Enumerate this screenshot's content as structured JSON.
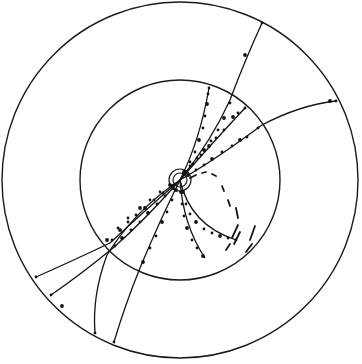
{
  "display": {
    "type": "particle-event-display",
    "width": 362,
    "height": 364,
    "colors": {
      "background": "#ffffff",
      "ink": "#141414"
    }
  },
  "detector": {
    "center": [
      180,
      180
    ],
    "outer_ring_radius": 178,
    "inner_ring_radius": 100,
    "vertex_rings": [
      7,
      11
    ]
  },
  "tracks": [
    {
      "id": "t1",
      "path": "M180,180 Q212,140 230,100 Q245,60 262,23",
      "hits": [
        [
          184,
          174
        ],
        [
          190,
          166
        ],
        [
          197,
          158
        ],
        [
          204,
          150
        ],
        [
          211,
          141
        ],
        [
          218,
          130
        ],
        [
          224,
          118
        ],
        [
          230,
          103
        ],
        [
          262,
          23
        ],
        [
          245,
          55
        ]
      ]
    },
    {
      "id": "t2",
      "path": "M180,180 Q215,160 262,125 Q300,105 336,101",
      "hits": [
        [
          188,
          175
        ],
        [
          196,
          170
        ],
        [
          204,
          165
        ],
        [
          212,
          159
        ],
        [
          222,
          152
        ],
        [
          232,
          146
        ],
        [
          240,
          140
        ],
        [
          247,
          137
        ],
        [
          258,
          128
        ],
        [
          330,
          101
        ],
        [
          336,
          101
        ]
      ]
    },
    {
      "id": "t3",
      "path": "M180,180 Q215,140 245,108",
      "hits": [
        [
          186,
          172
        ],
        [
          193,
          164
        ],
        [
          201,
          155
        ],
        [
          209,
          146
        ],
        [
          216,
          138
        ],
        [
          224,
          130
        ],
        [
          233,
          117
        ],
        [
          238,
          113
        ],
        [
          245,
          108
        ]
      ]
    },
    {
      "id": "t4",
      "path": "M180,180 Q200,140 209,88",
      "hits": [
        [
          184,
          172
        ],
        [
          190,
          162
        ],
        [
          195,
          152
        ],
        [
          199,
          140
        ],
        [
          203,
          128
        ],
        [
          205,
          116
        ],
        [
          207,
          104
        ],
        [
          208,
          94
        ],
        [
          209,
          88
        ]
      ]
    },
    {
      "id": "t5",
      "path": "M180,180 Q140,215 110,243 Q70,262 36,277",
      "hits": [
        [
          172,
          186
        ],
        [
          163,
          193
        ],
        [
          154,
          200
        ],
        [
          145,
          208
        ],
        [
          136,
          215
        ],
        [
          128,
          222
        ],
        [
          120,
          230
        ],
        [
          112,
          240
        ],
        [
          36,
          277
        ]
      ]
    },
    {
      "id": "t6",
      "path": "M180,180 Q145,220 113,248 Q80,275 51,295",
      "hits": [
        [
          173,
          188
        ],
        [
          165,
          196
        ],
        [
          157,
          204
        ],
        [
          148,
          213
        ],
        [
          140,
          222
        ],
        [
          131,
          230
        ],
        [
          122,
          238
        ],
        [
          115,
          246
        ],
        [
          51,
          295
        ],
        [
          62,
          306
        ]
      ]
    },
    {
      "id": "t7",
      "path": "M180,180 Q135,210 107,255 Q92,295 95,333",
      "hits": [
        [
          170,
          185
        ],
        [
          160,
          192
        ],
        [
          150,
          200
        ],
        [
          140,
          208
        ],
        [
          128,
          218
        ],
        [
          118,
          228
        ],
        [
          107,
          240
        ],
        [
          95,
          333
        ]
      ]
    },
    {
      "id": "t8",
      "path": "M180,180 Q160,220 140,268 Q125,305 114,342",
      "hits": [
        [
          176,
          190
        ],
        [
          172,
          200
        ],
        [
          167,
          212
        ],
        [
          162,
          222
        ],
        [
          156,
          236
        ],
        [
          150,
          248
        ],
        [
          143,
          262
        ],
        [
          114,
          342
        ]
      ]
    },
    {
      "id": "t9",
      "path": "M180,180 Q183,225 205,258",
      "hits": [
        [
          181,
          192
        ],
        [
          182,
          204
        ],
        [
          184,
          216
        ],
        [
          187,
          228
        ],
        [
          192,
          240
        ],
        [
          197,
          248
        ],
        [
          203,
          256
        ]
      ]
    },
    {
      "id": "t10",
      "path": "M180,180 Q190,225 236,240",
      "hits": [
        [
          183,
          192
        ],
        [
          186,
          204
        ],
        [
          190,
          214
        ],
        [
          196,
          222
        ],
        [
          204,
          229
        ],
        [
          212,
          233
        ],
        [
          220,
          236
        ],
        [
          228,
          238
        ],
        [
          236,
          240
        ]
      ]
    }
  ],
  "curl_segments": [
    "M190,178 L196,175",
    "M202,173 L206,172",
    "M212,174 L216,176",
    "M222,186 L224,191",
    "M228,200 L230,206",
    "M236,208 L238,218",
    "M238,225 L232,238",
    "M240,232 L234,244",
    "M230,244 L226,250",
    "M255,226 L250,240",
    "M252,244 L246,252"
  ]
}
